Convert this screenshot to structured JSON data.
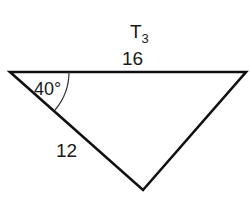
{
  "diagram": {
    "title": "T",
    "title_subscript": "3",
    "top_side_label": "16",
    "left_side_label": "12",
    "angle_label": "40°",
    "stroke_color": "#111111",
    "vertices": {
      "top_left": [
        10,
        72
      ],
      "top_right": [
        246,
        72
      ],
      "bottom": [
        143,
        190
      ]
    }
  }
}
